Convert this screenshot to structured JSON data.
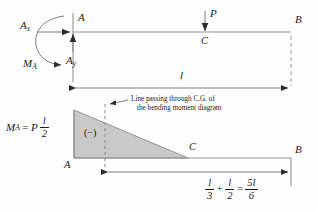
{
  "diagram": {
    "title_note": "Cantilever beam free-body diagram and bending moment diagram",
    "colors": {
      "line": "#6b6b6b",
      "ink": "#1a1a1a",
      "fill": "#c9c9c9",
      "background": "#fefefe"
    }
  },
  "top_beam": {
    "node_a_label": "A",
    "node_b_label": "B",
    "node_c_label": "C",
    "load_label": "P",
    "reaction_x_label": "A",
    "reaction_x_sub": "x",
    "reaction_y_label": "A",
    "reaction_y_sub": "y",
    "moment_label": "M",
    "moment_sub": "A",
    "span_label": "l"
  },
  "bmd": {
    "node_a_label": "A",
    "node_b_label": "B",
    "node_c_label": "C",
    "sign_label": "(−)",
    "moment_value": {
      "symbol": "M",
      "sub": "A",
      "equals": "=",
      "coef": "P",
      "num": "l",
      "den": "2"
    },
    "cg_note_line1": "Line passing through C.G. of",
    "cg_note_line2": "the bending moment diagram",
    "dimension_eq": {
      "t1_num": "l",
      "t1_den": "3",
      "plus": "+",
      "t2_num": "l",
      "t2_den": "2",
      "equals": "=",
      "t3_num": "5l",
      "t3_den": "6"
    }
  }
}
